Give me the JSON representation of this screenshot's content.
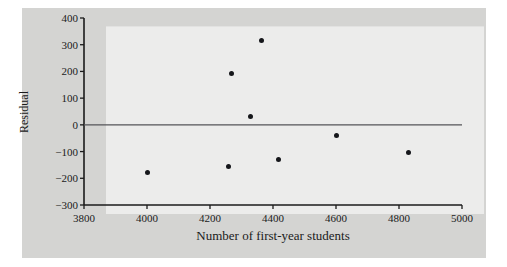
{
  "chart_data": {
    "type": "scatter",
    "title": "",
    "xlabel": "Number of first-year students",
    "ylabel": "Residual",
    "xlim": [
      3800,
      5000
    ],
    "ylim": [
      -300,
      400
    ],
    "xticks": [
      3800,
      4000,
      4200,
      4400,
      4600,
      4800,
      5000
    ],
    "xtick_labels": [
      "3800",
      "4000",
      "4200",
      "4400",
      "4600",
      "4800",
      "5000"
    ],
    "yticks": [
      400,
      300,
      200,
      100,
      0,
      -100,
      -200,
      -300
    ],
    "ytick_labels": [
      "400",
      "300",
      "200",
      "100",
      "0",
      "−100",
      "−200",
      "−300"
    ],
    "grid": false,
    "legend": null,
    "reference_line": {
      "axis": "y",
      "value": 0
    },
    "points": [
      {
        "x": 4000,
        "y": -180
      },
      {
        "x": 4260,
        "y": -155
      },
      {
        "x": 4267,
        "y": 193
      },
      {
        "x": 4330,
        "y": 30
      },
      {
        "x": 4365,
        "y": 315
      },
      {
        "x": 4416,
        "y": -128
      },
      {
        "x": 4600,
        "y": -38
      },
      {
        "x": 4830,
        "y": -105
      }
    ]
  },
  "figure": {
    "background_color": "#d4d4d2",
    "plot_background_color": "#ececeb",
    "axis_color": "#1b1b1b",
    "point_color": "#15161a"
  }
}
